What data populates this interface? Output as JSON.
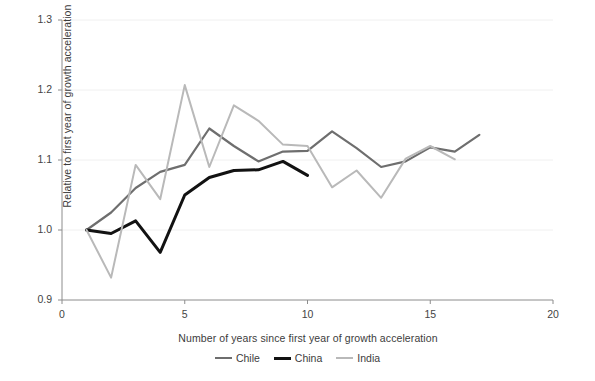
{
  "figure": {
    "clipped_header": "",
    "source_note": ""
  },
  "axes": {
    "y_label": "Relative to first year of growth acceleration",
    "x_label": "Number of years since first year of growth acceleration",
    "y_ticks": [
      "1.3",
      "1.2",
      "1.1",
      "1.0",
      "0.9"
    ],
    "x_ticks": [
      "0",
      "5",
      "10",
      "15",
      "20"
    ]
  },
  "colors": {
    "chile": "#6e6e6e",
    "china": "#121212",
    "india": "#b9b9b9",
    "axis": "#8c8c8c",
    "grid": "#f0f0f0",
    "text": "#3c3c3c"
  },
  "legend": {
    "items": [
      {
        "label": "Chile",
        "color": "#6e6e6e",
        "width": "2.2"
      },
      {
        "label": "China",
        "color": "#121212",
        "width": "3.0"
      },
      {
        "label": "India",
        "color": "#b9b9b9",
        "width": "2.0"
      }
    ]
  },
  "chart_data": {
    "type": "line",
    "title": "",
    "xlabel": "Number of years since first year of growth acceleration",
    "ylabel": "Relative to first year of growth acceleration",
    "xlim": [
      0,
      20
    ],
    "ylim": [
      0.9,
      1.3
    ],
    "xticks": [
      0,
      5,
      10,
      15,
      20
    ],
    "yticks": [
      0.9,
      1.0,
      1.1,
      1.2,
      1.3
    ],
    "grid": "horizontal",
    "legend_position": "bottom-center",
    "series": [
      {
        "name": "Chile",
        "color": "#6e6e6e",
        "x": [
          1,
          2,
          3,
          4,
          5,
          6,
          7,
          8,
          9,
          10,
          11,
          12,
          13,
          14,
          15,
          16,
          17
        ],
        "values": [
          1.0,
          1.025,
          1.06,
          1.083,
          1.093,
          1.145,
          1.12,
          1.098,
          1.112,
          1.113,
          1.141,
          1.117,
          1.09,
          1.098,
          1.118,
          1.112,
          1.136
        ]
      },
      {
        "name": "China",
        "color": "#121212",
        "x": [
          1,
          2,
          3,
          4,
          5,
          6,
          7,
          8,
          9,
          10
        ],
        "values": [
          1.0,
          0.995,
          1.013,
          0.968,
          1.05,
          1.075,
          1.085,
          1.086,
          1.098,
          1.078
        ]
      },
      {
        "name": "India",
        "color": "#b9b9b9",
        "x": [
          1,
          2,
          3,
          4,
          5,
          6,
          7,
          8,
          9,
          10,
          11,
          12,
          13,
          14,
          15,
          16
        ],
        "values": [
          1.0,
          0.932,
          1.093,
          1.044,
          1.207,
          1.09,
          1.178,
          1.156,
          1.122,
          1.12,
          1.061,
          1.085,
          1.046,
          1.102,
          1.12,
          1.101
        ]
      }
    ]
  }
}
